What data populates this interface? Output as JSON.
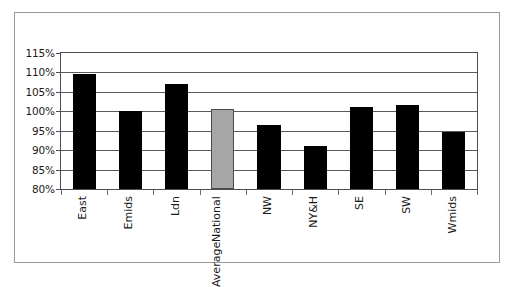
{
  "chart_data": {
    "type": "bar",
    "title": "",
    "subtitle": "",
    "xlabel": "",
    "ylabel": "",
    "categories": [
      "East",
      "Emids",
      "Ldn",
      "National Average",
      "NW",
      "NY&H",
      "SE",
      "SW",
      "Wmids"
    ],
    "category_lines": [
      [
        "East"
      ],
      [
        "Emids"
      ],
      [
        "Ldn"
      ],
      [
        "National",
        "Average"
      ],
      [
        "NW"
      ],
      [
        "NY&H"
      ],
      [
        "SE"
      ],
      [
        "SW"
      ],
      [
        "Wmids"
      ]
    ],
    "values": [
      109.5,
      100.0,
      107.0,
      100.5,
      96.5,
      91.0,
      101.0,
      101.5,
      94.8
    ],
    "value_labels": [
      "109.5%",
      "100.0%",
      "107.0%",
      "100.5%",
      "96.5%",
      "91.0%",
      "101.0%",
      "101.5%",
      "94.8%"
    ],
    "bar_colors": [
      "#000000",
      "#000000",
      "#000000",
      "#a6a6a6",
      "#000000",
      "#000000",
      "#000000",
      "#000000",
      "#000000"
    ],
    "highlight_index": 3,
    "highlight_color": "#a6a6a6",
    "series_color": "#000000",
    "ylim": [
      80,
      115
    ],
    "ytick_step": 5,
    "ytick_labels": [
      "115%",
      "110%",
      "105%",
      "100%",
      "95%",
      "90%",
      "85%",
      "80%"
    ],
    "ytick_values": [
      115,
      110,
      105,
      100,
      95,
      90,
      85,
      80
    ],
    "grid": true,
    "grid_color": "#5a5a5a",
    "legend": [],
    "legend_position": "none",
    "frame_color": "#9a9a9a",
    "axis_color": "#4d4d4d",
    "background": "#ffffff"
  }
}
